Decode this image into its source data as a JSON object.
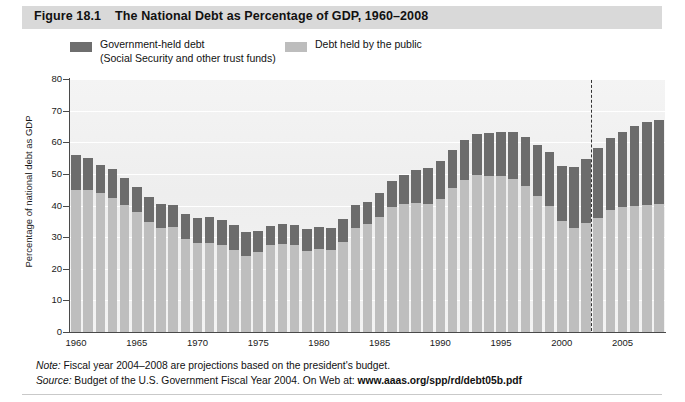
{
  "figure": {
    "number": "Figure 18.1",
    "title": "The National Debt as Percentage of GDP, 1960–2008"
  },
  "legend": {
    "gov_label_line1": "Government-held debt",
    "gov_label_line2": "(Social Security and other trust funds)",
    "public_label": "Debt held by the public",
    "gov_color": "#6c6c6c",
    "public_color": "#bebebe"
  },
  "notes": {
    "note_label": "Note:",
    "note_text": " Fiscal year 2004–2008 are projections based on the president's budget.",
    "source_label": "Source:",
    "source_text": " Budget of the U.S. Government Fiscal Year 2004. On Web at: ",
    "source_url": "www.aaas.org/spp/rd/debt05b.pdf"
  },
  "chart_data": {
    "type": "bar",
    "title": "The National Debt as Percentage of GDP, 1960–2008",
    "xlabel": "",
    "ylabel": "Percentage of national debt as GDP",
    "ylim": [
      0,
      80
    ],
    "ytick_step": 10,
    "yticks": [
      0,
      10,
      20,
      30,
      40,
      50,
      60,
      70,
      80
    ],
    "xticks": [
      1960,
      1965,
      1970,
      1975,
      1980,
      1985,
      1990,
      1995,
      2000,
      2005
    ],
    "grid": true,
    "stacked": true,
    "legend_position": "above-plot",
    "annotation": {
      "projection_divider_year": 2003,
      "projection_divider_style": "dashed vertical line",
      "projection_years": [
        2004,
        2005,
        2006,
        2007,
        2008
      ]
    },
    "categories": [
      1960,
      1961,
      1962,
      1963,
      1964,
      1965,
      1966,
      1967,
      1968,
      1969,
      1970,
      1971,
      1972,
      1973,
      1974,
      1975,
      1976,
      1977,
      1978,
      1979,
      1980,
      1981,
      1982,
      1983,
      1984,
      1985,
      1986,
      1987,
      1988,
      1989,
      1990,
      1991,
      1992,
      1993,
      1994,
      1995,
      1996,
      1997,
      1998,
      1999,
      2000,
      2001,
      2002,
      2003,
      2004,
      2005,
      2006,
      2007,
      2008
    ],
    "series": [
      {
        "name": "Debt held by the public",
        "color": "#bebebe",
        "values": [
          45.0,
          44.9,
          44.0,
          42.4,
          40.1,
          37.9,
          34.8,
          32.8,
          33.3,
          29.3,
          28.0,
          28.1,
          27.4,
          26.0,
          23.9,
          25.3,
          27.5,
          27.8,
          27.4,
          25.6,
          26.1,
          25.8,
          28.6,
          33.0,
          34.1,
          36.4,
          39.6,
          40.6,
          40.9,
          40.6,
          42.1,
          45.4,
          48.2,
          49.5,
          49.4,
          49.2,
          48.5,
          46.1,
          43.1,
          39.8,
          35.1,
          33.0,
          34.4,
          36.2,
          38.5,
          39.5,
          40.0,
          40.3,
          40.5
        ]
      },
      {
        "name": "Government-held debt (Social Security and other trust funds)",
        "color": "#6c6c6c",
        "values": [
          10.9,
          10.0,
          8.9,
          9.3,
          8.6,
          8.0,
          7.9,
          7.7,
          7.0,
          8.0,
          8.0,
          8.2,
          7.9,
          7.7,
          7.8,
          6.5,
          6.1,
          6.5,
          6.6,
          6.9,
          7.0,
          7.1,
          7.2,
          7.1,
          7.0,
          7.6,
          8.2,
          9.2,
          10.2,
          11.2,
          12.0,
          12.2,
          12.4,
          13.0,
          13.6,
          14.2,
          14.9,
          15.6,
          16.1,
          17.0,
          17.4,
          19.1,
          20.2,
          22.1,
          22.9,
          23.9,
          25.0,
          26.0,
          26.5
        ]
      }
    ],
    "totals": [
      55.9,
      54.9,
      52.9,
      51.7,
      48.7,
      45.9,
      42.7,
      40.5,
      40.3,
      37.3,
      36.0,
      36.3,
      35.3,
      33.7,
      31.7,
      31.8,
      33.6,
      34.3,
      34.0,
      32.5,
      33.1,
      32.9,
      35.8,
      40.1,
      41.1,
      44.0,
      47.8,
      49.8,
      51.1,
      51.8,
      54.1,
      57.6,
      60.6,
      62.5,
      63.0,
      63.4,
      63.4,
      61.7,
      59.2,
      56.8,
      52.5,
      52.1,
      54.6,
      58.3,
      61.4,
      63.4,
      65.0,
      66.3,
      67.0
    ]
  }
}
